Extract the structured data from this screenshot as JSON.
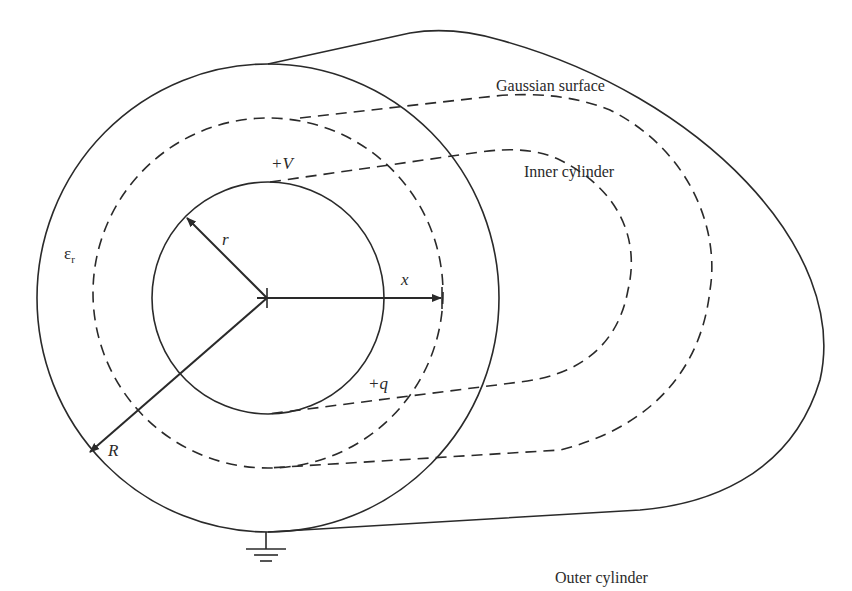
{
  "diagram": {
    "type": "coaxial-cylinder-capacitor",
    "labels": {
      "gaussian_surface": "Gaussian surface",
      "inner_cylinder": "Inner cylinder",
      "outer_cylinder": "Outer cylinder",
      "potential": "+V",
      "charge": "+q",
      "inner_radius": "r",
      "outer_radius": "R",
      "gaussian_radius": "x",
      "permittivity": "ε",
      "permittivity_sub": "r"
    },
    "colors": {
      "stroke": "#2a2a2a",
      "background": "#ffffff"
    }
  }
}
